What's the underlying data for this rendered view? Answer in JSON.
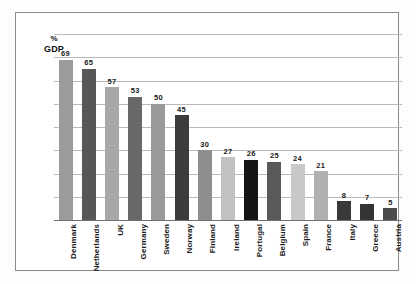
{
  "chart_data": {
    "type": "bar",
    "title": "",
    "subtitle": "",
    "xlabel": "",
    "ylabel": "% GDP",
    "ylabel_lines": [
      "%",
      "GDP"
    ],
    "ylim": [
      0,
      80
    ],
    "grid": true,
    "gridlines": [
      10,
      20,
      30,
      40,
      50,
      60,
      70,
      80
    ],
    "legend": "none",
    "show_value_labels": true,
    "categories": [
      "Denmark",
      "Netherlands",
      "UK",
      "Germany",
      "Sweden",
      "Norway",
      "Finland",
      "Ireland",
      "Portugal",
      "Belgium",
      "Spain",
      "France",
      "Italy",
      "Greece",
      "Austria"
    ],
    "values": [
      69,
      65,
      57,
      53,
      50,
      45,
      30,
      27,
      26,
      25,
      24,
      21,
      8,
      7,
      5
    ],
    "bar_colors": [
      "#9b9b9b",
      "#575757",
      "#a8a8a8",
      "#686868",
      "#9a9a9a",
      "#3c3c3c",
      "#8e8e8e",
      "#c2c2c2",
      "#151515",
      "#5a5a5a",
      "#c8c8c8",
      "#b0b0b0",
      "#3a3a3a",
      "#343434",
      "#4a4a4a"
    ]
  },
  "figure": {
    "frame_color": "#8b8b8b",
    "grid_color": "#b9b9b9",
    "axis_color": "#707070",
    "background": "#ffffff"
  }
}
